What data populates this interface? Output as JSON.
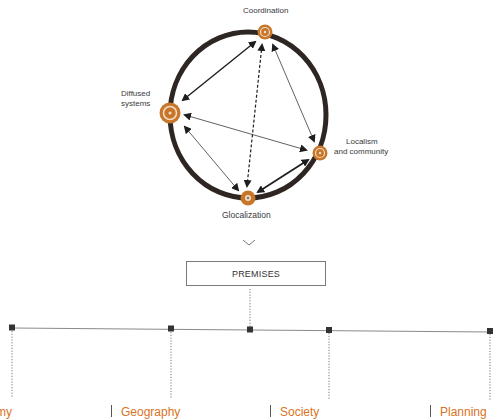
{
  "diagram": {
    "nodes": [
      {
        "id": "coordination",
        "label": "Coordination",
        "x": 265,
        "y": 32,
        "r": 7
      },
      {
        "id": "diffused",
        "label_line1": "Diffused",
        "label_line2": "systems",
        "x": 170,
        "y": 113,
        "r": 10
      },
      {
        "id": "localism",
        "label_line1": "Localism",
        "label_line2": "and community",
        "x": 320,
        "y": 153,
        "r": 7
      },
      {
        "id": "glocalization",
        "label": "Glocalization",
        "x": 248,
        "y": 198,
        "r": 7
      }
    ],
    "colors": {
      "ring": "#2e2623",
      "node_fill": "#c8772a",
      "node_ring": "#f3dcc4",
      "arrow": "#1e1e1e",
      "category_text": "#d9731f",
      "tree_line": "#8a8a8a",
      "tree_dot": "#333333"
    },
    "premises_label": "PREMISES",
    "chevron": "chevron-down",
    "categories": [
      {
        "label": "Economy",
        "x": -38
      },
      {
        "label": "Geography",
        "x": 121
      },
      {
        "label": "Society",
        "x": 280
      },
      {
        "label": "Planning",
        "x": 440
      }
    ],
    "separators": [
      111,
      270,
      430
    ]
  }
}
